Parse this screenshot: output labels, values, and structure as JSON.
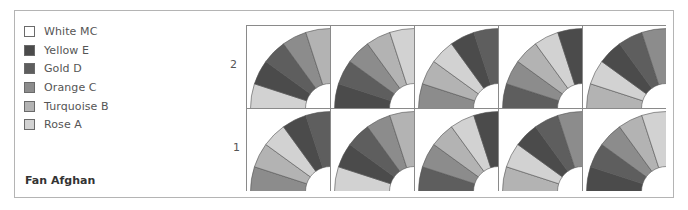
{
  "title": "Fan Afghan",
  "legend": [
    {
      "key": "MC",
      "label": "White MC",
      "color": "#ffffff"
    },
    {
      "key": "E",
      "label": "Yellow E",
      "color": "#4b4b4b"
    },
    {
      "key": "D",
      "label": "Gold D",
      "color": "#5e5e5e"
    },
    {
      "key": "C",
      "label": "Orange C",
      "color": "#8c8c8c"
    },
    {
      "key": "B",
      "label": "Turquoise  B",
      "color": "#b3b3b3"
    },
    {
      "key": "A",
      "label": "Rose A",
      "color": "#d2d2d2"
    }
  ],
  "row_labels": [
    "2",
    "1"
  ],
  "grid": {
    "rows": [
      {
        "label": "2",
        "blocks": [
          [
            "A",
            "E",
            "D",
            "C",
            "B"
          ],
          [
            "E",
            "D",
            "C",
            "B",
            "A"
          ],
          [
            "C",
            "B",
            "A",
            "E",
            "D"
          ],
          [
            "D",
            "C",
            "B",
            "A",
            "E"
          ],
          [
            "B",
            "A",
            "E",
            "D",
            "C"
          ]
        ]
      },
      {
        "label": "1",
        "blocks": [
          [
            "C",
            "B",
            "A",
            "E",
            "D"
          ],
          [
            "A",
            "E",
            "D",
            "C",
            "B"
          ],
          [
            "D",
            "C",
            "B",
            "A",
            "E"
          ],
          [
            "B",
            "A",
            "E",
            "D",
            "C"
          ],
          [
            "E",
            "D",
            "C",
            "B",
            "A"
          ]
        ]
      }
    ]
  }
}
